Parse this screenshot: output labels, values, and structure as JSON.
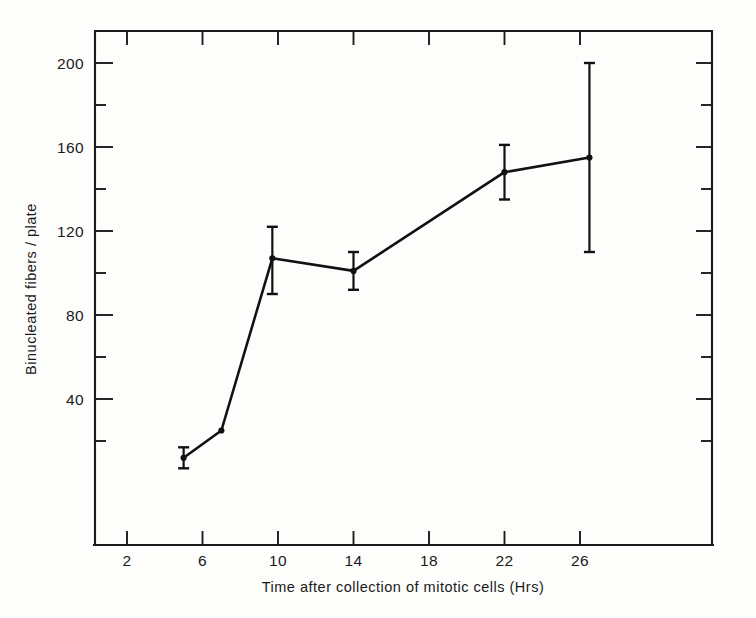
{
  "chart_data": {
    "type": "line",
    "title": "",
    "xlabel": "Time after collection of mitotic cells (Hrs)",
    "ylabel": "Binucleated fibers / plate",
    "xlim": [
      0,
      28
    ],
    "ylim": [
      0,
      215
    ],
    "grid": false,
    "legend": "none",
    "x_ticks_major": [
      2,
      6,
      10,
      14,
      18,
      22,
      26
    ],
    "x_tick_labels": [
      "2",
      "6",
      "10",
      "14",
      "18",
      "22",
      "26"
    ],
    "y_ticks_major": [
      40,
      80,
      120,
      160,
      200
    ],
    "y_tick_labels": [
      "40",
      "80",
      "120",
      "160",
      "200"
    ],
    "y_ticks_minor": [
      20,
      60,
      100,
      140,
      180
    ],
    "x_ticks_minor": [
      4,
      8,
      12,
      16,
      20,
      24,
      28
    ],
    "series": [
      {
        "name": "Binucleated fibers / plate",
        "marker": "filled-circle",
        "x": [
          5.0,
          7.0,
          9.7,
          14.0,
          22.0,
          26.5
        ],
        "y": [
          12,
          25,
          107,
          101,
          148,
          155
        ],
        "yerr_low": [
          7,
          25,
          90,
          92,
          135,
          110
        ],
        "yerr_high": [
          17,
          25,
          122,
          110,
          161,
          200
        ]
      }
    ],
    "colors": {
      "line": "#111111",
      "marker": "#111111",
      "error_bar": "#111111",
      "axis": "#1b1b1b",
      "background": "#fdfdfc"
    }
  },
  "figure": {
    "caption": "",
    "axis_titles": {
      "x": "Time after collection of mitotic cells (Hrs)",
      "y": "Binucleated fibers / plate"
    }
  }
}
